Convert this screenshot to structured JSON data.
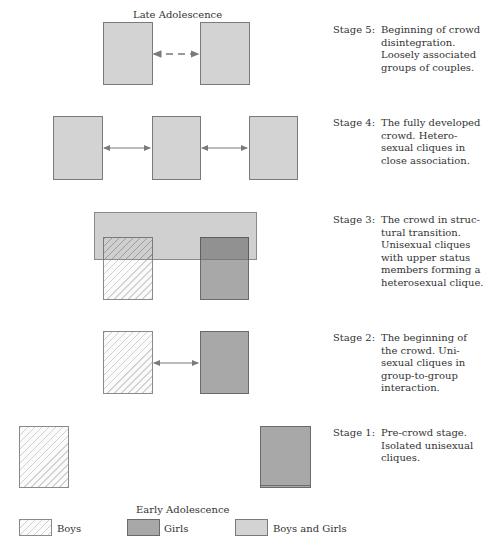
{
  "diagram": {
    "top_label": "Late Adolescence",
    "bottom_label": "Early Adolescence",
    "stages": [
      {
        "id": 5,
        "label": "Stage 5:",
        "description_lines": [
          "Beginning of crowd",
          "disintegration.",
          "Loosely associated",
          "groups of couples."
        ],
        "groups": [
          "Boys and Girls",
          "Boys and Girls"
        ],
        "connection": "dashed double arrow"
      },
      {
        "id": 4,
        "label": "Stage 4:",
        "description_lines": [
          "The fully developed",
          "crowd.  Hetero-",
          "sexual cliques in",
          "close association."
        ],
        "groups": [
          "Boys and Girls",
          "Boys and Girls",
          "Boys and Girls"
        ],
        "connection": "solid double arrows"
      },
      {
        "id": 3,
        "label": "Stage 3:",
        "description_lines": [
          "The crowd in struc-",
          "tural transition.",
          "Unisexual cliques",
          "with upper status",
          "members forming a",
          "heterosexual clique."
        ],
        "groups": [
          "Boys",
          "Girls",
          "Boys and Girls (overlay)"
        ],
        "connection": "overlap"
      },
      {
        "id": 2,
        "label": "Stage 2:",
        "description_lines": [
          "The beginning of",
          "the crowd.  Uni-",
          "sexual cliques in",
          "group-to-group",
          "interaction."
        ],
        "groups": [
          "Boys",
          "Girls"
        ],
        "connection": "solid double arrow"
      },
      {
        "id": 1,
        "label": "Stage 1:",
        "description_lines": [
          "Pre-crowd stage.",
          "Isolated unisexual",
          "cliques."
        ],
        "groups": [
          "Boys",
          "Girls"
        ],
        "connection": "none"
      }
    ]
  },
  "legend": {
    "items": [
      {
        "label": "Boys",
        "pattern": "hatched"
      },
      {
        "label": "Girls",
        "pattern": "dark-gray"
      },
      {
        "label": "Boys and Girls",
        "pattern": "light-gray"
      }
    ]
  },
  "colors": {
    "boys_and_girls": "#d3d3d3",
    "girls": "#a8a8a8",
    "boys_hatch": "#d2d2d2",
    "arrow": "#7a7a7a",
    "border": "#7a7a7a"
  }
}
